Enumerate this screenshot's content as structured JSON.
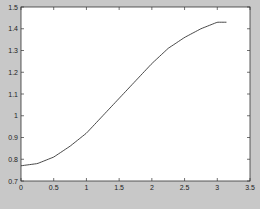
{
  "chart_data": {
    "type": "line",
    "title": "",
    "xlabel": "",
    "ylabel": "",
    "xlim": [
      0,
      3.5
    ],
    "ylim": [
      0.7,
      1.5
    ],
    "grid": false,
    "legend": null,
    "xticks": [
      "0",
      "0.5",
      "1",
      "1.5",
      "2",
      "2.5",
      "3",
      "3.5"
    ],
    "yticks": [
      "0.7",
      "0.8",
      "0.9",
      "1",
      "1.1",
      "1.2",
      "1.3",
      "1.4",
      "1.5"
    ],
    "series": [
      {
        "name": "curve",
        "color": "#333333",
        "x": [
          0,
          0.25,
          0.5,
          0.75,
          1.0,
          1.25,
          1.5,
          1.75,
          2.0,
          2.25,
          2.5,
          2.75,
          3.0,
          3.14
        ],
        "y": [
          0.77,
          0.78,
          0.81,
          0.86,
          0.92,
          1.0,
          1.08,
          1.16,
          1.24,
          1.31,
          1.36,
          1.4,
          1.43,
          1.43
        ]
      }
    ]
  },
  "colors": {
    "figure_background": "#c8c8c8",
    "plot_background": "#ffffff",
    "axis": "#333333",
    "line": "#333333"
  }
}
